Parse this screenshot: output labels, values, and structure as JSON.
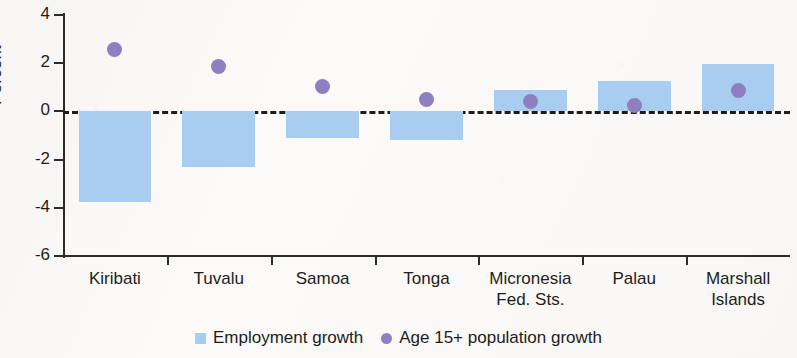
{
  "chart_data": {
    "type": "bar",
    "title": "",
    "xlabel": "",
    "ylabel": "Percent",
    "ylim": [
      -6,
      4
    ],
    "yticks": [
      4,
      2,
      0,
      -2,
      -4,
      -6
    ],
    "ytick_labels": [
      "4",
      "2",
      "0",
      "-2",
      "-4",
      "-6"
    ],
    "grid": false,
    "zero_line": true,
    "legend_position": "bottom-center",
    "categories": [
      "Kiribati",
      "Tuvalu",
      "Samoa",
      "Tonga",
      "Micronesia Fed. Sts.",
      "Palau",
      "Marshall Islands"
    ],
    "category_lines": [
      [
        "Kiribati",
        ""
      ],
      [
        "Tuvalu",
        ""
      ],
      [
        "Samoa",
        ""
      ],
      [
        "Tonga",
        ""
      ],
      [
        "Micronesia",
        "Fed. Sts."
      ],
      [
        "Palau",
        ""
      ],
      [
        "Marshall",
        "Islands"
      ]
    ],
    "series": [
      {
        "name": "Employment growth",
        "type": "bar",
        "color": "#a8cdf0",
        "values": [
          -3.75,
          -2.3,
          -1.1,
          -1.2,
          0.9,
          1.25,
          1.95
        ]
      },
      {
        "name": "Age 15+ population growth",
        "type": "scatter",
        "color": "#8d7fc0",
        "values": [
          2.55,
          1.85,
          1.05,
          0.5,
          0.4,
          0.25,
          0.85
        ]
      }
    ]
  },
  "legend": {
    "items": [
      {
        "label": "Employment growth",
        "marker": "square-swatch-icon"
      },
      {
        "label": "Age 15+ population growth",
        "marker": "circle-dot-icon"
      }
    ]
  }
}
